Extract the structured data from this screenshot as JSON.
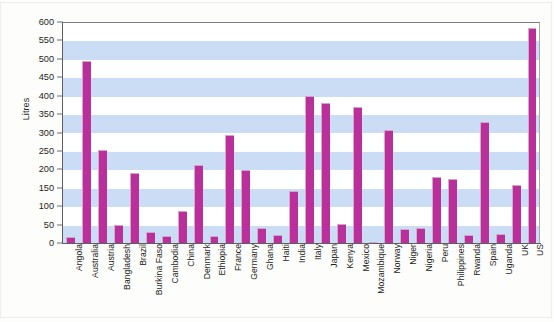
{
  "figure": {
    "kind": "bar-chart-image",
    "background_color": "#fdfdfc"
  },
  "chart_data": {
    "type": "bar",
    "title": "",
    "xlabel": "",
    "ylabel": "Litres",
    "ylim": [
      0,
      600
    ],
    "ytick_step": 50,
    "yticks": [
      0,
      50,
      100,
      150,
      200,
      250,
      300,
      350,
      400,
      450,
      500,
      550,
      600
    ],
    "ytick_labels": [
      "0",
      "50",
      "100",
      "150",
      "200",
      "250",
      "300",
      "350",
      "400",
      "450",
      "500",
      "550",
      "600"
    ],
    "grid": false,
    "banding": "alternating horizontal light-blue bands every 50 units",
    "legend": null,
    "bar_color": "#b9309b",
    "bar_highlight_color": "#d9a6ce",
    "band_color": "#cbddf5",
    "plot_background": "#ffffff",
    "axis_color": "#5e5e63",
    "categories": [
      "Angola",
      "Australia",
      "Austria",
      "Bangladesh",
      "Brazil",
      "Burkina Faso",
      "Cambodia",
      "China",
      "Denmark",
      "Ethiopia",
      "France",
      "Germany",
      "Ghana",
      "Haiti",
      "India",
      "Italy",
      "Japan",
      "Kenya",
      "Mexico",
      "Mozambique",
      "Norway",
      "Niger",
      "Nigeria",
      "Peru",
      "Philippines",
      "Rwanda",
      "Spain",
      "Uganda",
      "UK",
      "US"
    ],
    "values": [
      16,
      495,
      252,
      48,
      190,
      30,
      19,
      88,
      213,
      20,
      293,
      198,
      40,
      23,
      140,
      398,
      380,
      52,
      370,
      3,
      308,
      37,
      42,
      180,
      173,
      22,
      328,
      24,
      158,
      585
    ]
  }
}
